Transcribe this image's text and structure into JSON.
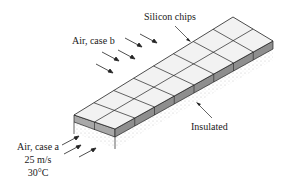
{
  "labels": {
    "silicon_chips": "Silicon chips",
    "air_case_b": "Air, case b",
    "insulated": "Insulated",
    "air_case_a": "Air, case a",
    "air_case_a_speed": "25 m/s",
    "air_case_a_temp": "30°C"
  },
  "figure": {
    "chip_rows": 2,
    "chip_columns": 8,
    "chip_fill": "#f2f2f2",
    "chip_side_fill": "#9a9a9a",
    "insulation_fill": "#ffffff",
    "line_color": "#222222"
  }
}
